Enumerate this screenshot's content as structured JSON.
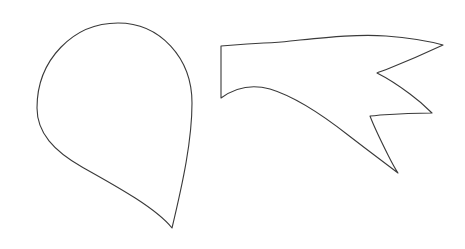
{
  "canvas": {
    "width": 465,
    "height": 249,
    "background_color": "#ffffff",
    "description": "Two black-and-white line-drawing outline shapes on a plain white background"
  },
  "style": {
    "stroke_color": "#3a3a3a",
    "fill_color": "#ffffff",
    "stroke_width": 1.1
  },
  "shapes": [
    {
      "name": "teardrop-outline",
      "label": "teardrop",
      "bbox": {
        "x": 37,
        "y": 23,
        "width": 155,
        "height": 205
      },
      "apex_point": {
        "x": 172,
        "y": 228
      },
      "top_point": {
        "x": 118,
        "y": 23
      },
      "leftmost_point": {
        "x": 37,
        "y": 110
      },
      "rightmost_point": {
        "x": 192,
        "y": 108
      },
      "path": "M 118 23 C 160 23 192 58 192 103 C 192 140 183 182 172 228 C 156 208 116 186 82 167 C 54 151 37 133 37 108 C 37 60 73 23 118 23 Z"
    },
    {
      "name": "three-pronged-claw-outline",
      "label": "three-pronged claw",
      "bbox": {
        "x": 220,
        "y": 33,
        "width": 223,
        "height": 141
      },
      "stem_top_left": {
        "x": 221,
        "y": 46
      },
      "stem_bottom_left": {
        "x": 221,
        "y": 98
      },
      "prong_tips": [
        {
          "name": "upper-prong-tip",
          "x": 443,
          "y": 45
        },
        {
          "name": "middle-prong-tip",
          "x": 432,
          "y": 113
        },
        {
          "name": "lower-prong-tip",
          "x": 398,
          "y": 173
        }
      ],
      "notches": [
        {
          "name": "upper-notch",
          "x": 377,
          "y": 73
        },
        {
          "name": "lower-notch",
          "x": 370,
          "y": 116
        }
      ],
      "path": "M 221 46 L 247 44 C 268 43 285 42 300 40 C 330 37 360 34 386 36 C 412 38 432 42 443 45 C 428 52 405 62 390 68 C 383 71 379 72 377 73 C 383 76 398 85 410 94 C 421 102 428 109 432 113 C 416 113 395 114 380 115 C 374 116 371 116 370 116 C 373 124 381 141 388 155 C 393 165 396 170 398 173 C 386 164 365 148 348 135 C 320 113 293 96 270 89 C 252 84 236 87 221 98 Z"
    }
  ]
}
